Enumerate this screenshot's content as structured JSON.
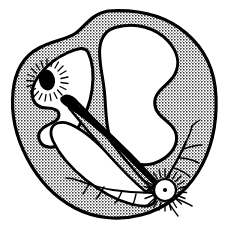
{
  "figure": {
    "title": "Cardiac conduction system — heart cross-section",
    "type": "anatomical-line-drawing",
    "style": "black-and-white stipple/halftone engraving",
    "width": 230,
    "height": 232,
    "background_color": "#ffffff",
    "ink_color": "#000000",
    "myocardium_fill_color": "#b9b9b9",
    "chamber_fill_color": "#ffffff",
    "outline_width": 3
  },
  "structures": {
    "myocardium": {
      "name": "myocardium-wall",
      "description": "Stippled halftone muscular heart wall forming the outer silhouette",
      "fill": "#b9b9b9"
    },
    "left_chamber": {
      "name": "left-chamber-cavity",
      "description": "Upper-left white chamber cavity with notched inner border",
      "fill": "#ffffff"
    },
    "upper_chamber": {
      "name": "upper-right-chamber-cavity",
      "description": "Large lobed white chamber occupying the upper right",
      "fill": "#ffffff"
    },
    "lower_chamber": {
      "name": "lower-right-chamber-cavity",
      "description": "White ventricular cavity on the right side",
      "fill": "#ffffff"
    },
    "septum": {
      "name": "interventricular-septum",
      "description": "Stippled diagonal band dividing the two ventricles"
    },
    "sa_node": {
      "name": "sinoatrial-node",
      "label": "SA node",
      "cx": 47,
      "cy": 80,
      "rx": 8,
      "ry": 10,
      "marker": "solid black ellipse with radiating spokes",
      "spokes": 22,
      "fill": "#000000"
    },
    "av_node": {
      "name": "atrioventricular-node",
      "label": "AV node",
      "cx": 165,
      "cy": 190,
      "r": 11,
      "marker": "white circle with centre dot and radiating spokes",
      "spokes": 26,
      "fill": "#ffffff",
      "dot_r": 2
    },
    "bundle": {
      "name": "conduction-bundle",
      "description": "Thick tapered black bundle with bulbous tip running down the septum from upper left to the AV node"
    },
    "purkinje_fibers": {
      "name": "purkinje-fibers",
      "description": "Fine branching conduction fibers spreading through both ventricle walls from the AV node",
      "branch_count": 12
    }
  }
}
